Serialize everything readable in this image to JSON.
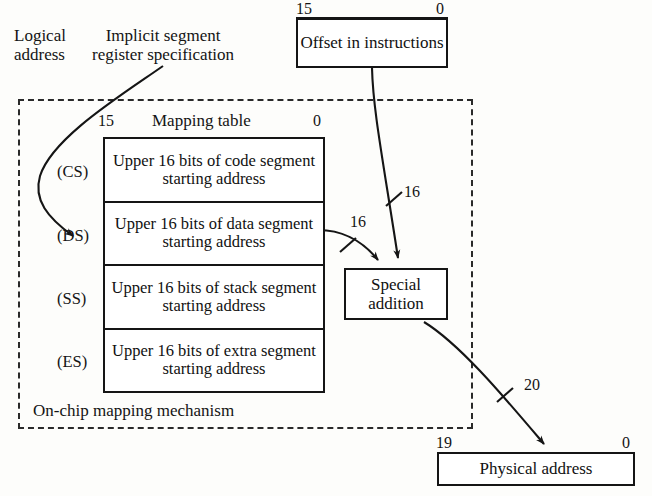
{
  "diagram": {
    "background_color": "#fdfdfb",
    "line_color": "#151515"
  },
  "annotations": {
    "logical_address": "Logical\naddress",
    "implicit_segment": "Implicit segment\nregister specification",
    "on_chip": "On-chip mapping mechanism",
    "mapping_table_title": "Mapping table"
  },
  "offset_box": {
    "label": "Offset\nin instructions",
    "msb": "15",
    "lsb": "0"
  },
  "mapping_table": {
    "msb": "15",
    "lsb": "0",
    "rows": [
      {
        "register": "(CS)",
        "text": "Upper 16 bits of\ncode segment\nstarting address"
      },
      {
        "register": "(DS)",
        "text": "Upper 16 bits of\ndata segment\nstarting address"
      },
      {
        "register": "(SS)",
        "text": "Upper 16 bits of\nstack segment\nstarting address"
      },
      {
        "register": "(ES)",
        "text": "Upper 16 bits of\nextra segment\nstarting address"
      }
    ]
  },
  "special_addition": {
    "label": "Special\naddition"
  },
  "physical_address": {
    "label": "Physical address",
    "msb": "19",
    "lsb": "0"
  },
  "bus_widths": {
    "segment_base": "16",
    "offset": "16",
    "physical": "20"
  }
}
